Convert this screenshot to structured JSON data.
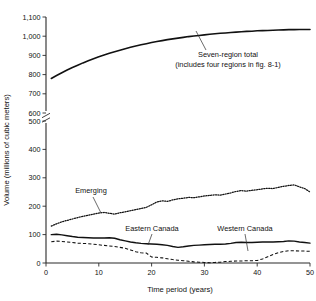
{
  "chart_data": {
    "type": "line",
    "title": "",
    "xlabel": "Time period (years)",
    "ylabel": "Volume (millions of cubic meters)",
    "xlim": [
      0,
      50
    ],
    "ylim": [
      0,
      1100
    ],
    "grid": false,
    "legend_position": "none",
    "axis_break": {
      "between": [
        500,
        600
      ],
      "symbol": "double-slash"
    },
    "xticks": [
      "0",
      "10",
      "20",
      "30",
      "40",
      "50"
    ],
    "xtick_values": [
      0,
      10,
      20,
      30,
      40,
      50
    ],
    "yticks": [
      "0",
      "100",
      "200",
      "300",
      "400",
      "500",
      "600",
      "700",
      "800",
      "900",
      "1,000",
      "1,100"
    ],
    "ytick_values": [
      0,
      100,
      200,
      300,
      400,
      500,
      600,
      700,
      800,
      900,
      1000,
      1100
    ],
    "annotations": [
      {
        "text": "Seven-region total",
        "series": "Seven-region total"
      },
      {
        "text": "(includes four regions in fig. 8-1)",
        "series": "Seven-region total"
      },
      {
        "text": "Emerging",
        "series": "Emerging"
      },
      {
        "text": "Eastern Canada",
        "series": "Eastern Canada"
      },
      {
        "text": "Western Canada",
        "series": "Western Canada"
      }
    ],
    "x": [
      1,
      2,
      3,
      4,
      5,
      6,
      7,
      8,
      9,
      10,
      11,
      12,
      13,
      14,
      15,
      16,
      17,
      18,
      19,
      20,
      21,
      22,
      23,
      24,
      25,
      26,
      27,
      28,
      29,
      30,
      31,
      32,
      33,
      34,
      35,
      36,
      37,
      38,
      39,
      40,
      41,
      42,
      43,
      44,
      45,
      46,
      47,
      48,
      49,
      50
    ],
    "series": [
      {
        "name": "Seven-region total",
        "style": "solid",
        "values": [
          780,
          795,
          810,
          824,
          837,
          849,
          861,
          872,
          883,
          893,
          902,
          911,
          919,
          927,
          935,
          942,
          949,
          955,
          961,
          967,
          972,
          977,
          982,
          986,
          990,
          994,
          998,
          1001,
          1004,
          1007,
          1010,
          1013,
          1015,
          1017,
          1019,
          1021,
          1023,
          1025,
          1026,
          1028,
          1029,
          1030,
          1031,
          1032,
          1033,
          1034,
          1034,
          1035,
          1035,
          1035
        ]
      },
      {
        "name": "Emerging",
        "style": "dotted",
        "values": [
          130,
          138,
          145,
          150,
          155,
          160,
          164,
          168,
          172,
          176,
          178,
          175,
          172,
          177,
          180,
          184,
          188,
          192,
          196,
          205,
          215,
          219,
          217,
          222,
          226,
          228,
          231,
          230,
          233,
          236,
          238,
          240,
          239,
          243,
          247,
          252,
          255,
          253,
          256,
          258,
          261,
          263,
          262,
          266,
          270,
          273,
          275,
          268,
          262,
          250
        ]
      },
      {
        "name": "Eastern Canada",
        "style": "solid",
        "values": [
          100,
          101,
          99,
          96,
          93,
          91,
          90,
          89,
          88,
          88,
          88,
          89,
          87,
          82,
          78,
          74,
          71,
          69,
          68,
          67,
          66,
          64,
          62,
          58,
          55,
          57,
          60,
          62,
          63,
          64,
          65,
          66,
          66,
          67,
          69,
          72,
          73,
          72,
          72,
          73,
          74,
          74,
          74,
          75,
          76,
          78,
          77,
          74,
          72,
          70
        ]
      },
      {
        "name": "Western Canada",
        "style": "dashed",
        "values": [
          75,
          77,
          76,
          74,
          72,
          70,
          69,
          68,
          66,
          64,
          62,
          60,
          58,
          55,
          52,
          46,
          40,
          36,
          35,
          21,
          20,
          18,
          15,
          12,
          10,
          8,
          6,
          4,
          3,
          2,
          1,
          2,
          3,
          5,
          6,
          7,
          7,
          8,
          8,
          9,
          14,
          22,
          30,
          36,
          41,
          43,
          43,
          42,
          42,
          41
        ]
      }
    ]
  },
  "axis_labels": {
    "y_title": "Volume (millions of cubic meters)",
    "x_title": "Time period (years)"
  },
  "annotations": {
    "total_line1": "Seven-region total",
    "total_line2": "(includes four regions in fig. 8-1)",
    "emerging": "Emerging",
    "eastern_canada": "Eastern Canada",
    "western_canada": "Western Canada"
  },
  "colors": {
    "ink": "#111111",
    "axis": "#2b2b2b",
    "background": "#ffffff"
  }
}
